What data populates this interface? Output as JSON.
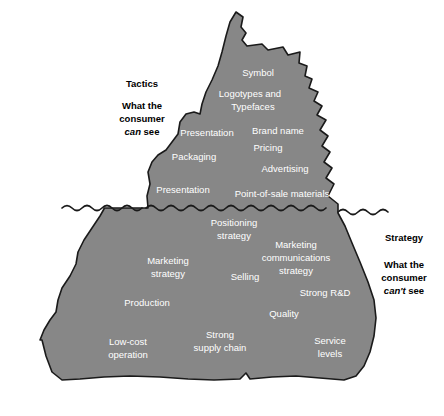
{
  "figure": {
    "type": "iceberg-diagram",
    "caption": "",
    "colors": {
      "iceberg_fill": "#878787",
      "iceberg_stroke": "#1a1a1a",
      "background": "#ffffff",
      "label_text": "#ffffff",
      "side_text": "#000000"
    }
  },
  "waterline": {
    "name": "waterline",
    "y": 208
  },
  "left_annotation": {
    "heading": "Tactics",
    "line1": "What the",
    "line2_italic": "can",
    "line2_rest": " see",
    "line2_full": "can see"
  },
  "right_annotation": {
    "heading": "Strategy",
    "line1": "What the",
    "line2": "consumer",
    "line3_italic": "can't",
    "line3_rest": " see",
    "line3_full": "can't see"
  },
  "shared": {
    "consumer": "consumer"
  },
  "above_water_labels": [
    {
      "text": "Symbol",
      "x": 258,
      "y": 73
    },
    {
      "text": "Logotypes and",
      "x": 250,
      "y": 94
    },
    {
      "text": "Typefaces",
      "x": 253,
      "y": 107
    },
    {
      "text": "Presentation",
      "x": 207,
      "y": 133
    },
    {
      "text": "Brand name",
      "x": 278,
      "y": 131
    },
    {
      "text": "Pricing",
      "x": 268,
      "y": 148
    },
    {
      "text": "Packaging",
      "x": 194,
      "y": 157
    },
    {
      "text": "Advertising",
      "x": 285,
      "y": 169
    },
    {
      "text": "Presentation",
      "x": 183,
      "y": 190
    },
    {
      "text": "Point-of-sale materials",
      "x": 282,
      "y": 194
    }
  ],
  "below_water_labels": [
    {
      "text": "Positioning",
      "x": 234,
      "y": 223
    },
    {
      "text": "strategy",
      "x": 234,
      "y": 236
    },
    {
      "text": "Marketing",
      "x": 168,
      "y": 261
    },
    {
      "text": "communications",
      "x": 296,
      "y": 258
    },
    {
      "text": "Marketing",
      "x": 296,
      "y": 245
    },
    {
      "text": "strategy",
      "x": 168,
      "y": 274
    },
    {
      "text": "strategy",
      "x": 296,
      "y": 271
    },
    {
      "text": "Selling",
      "x": 245,
      "y": 277
    },
    {
      "text": "Strong R&D",
      "x": 325,
      "y": 293
    },
    {
      "text": "Production",
      "x": 147,
      "y": 303
    },
    {
      "text": "Quality",
      "x": 284,
      "y": 314
    },
    {
      "text": "Low-cost",
      "x": 128,
      "y": 342
    },
    {
      "text": "operation",
      "x": 128,
      "y": 355
    },
    {
      "text": "Strong",
      "x": 220,
      "y": 335
    },
    {
      "text": "supply chain",
      "x": 220,
      "y": 348
    },
    {
      "text": "Service",
      "x": 330,
      "y": 341
    },
    {
      "text": "levels",
      "x": 330,
      "y": 354
    }
  ]
}
